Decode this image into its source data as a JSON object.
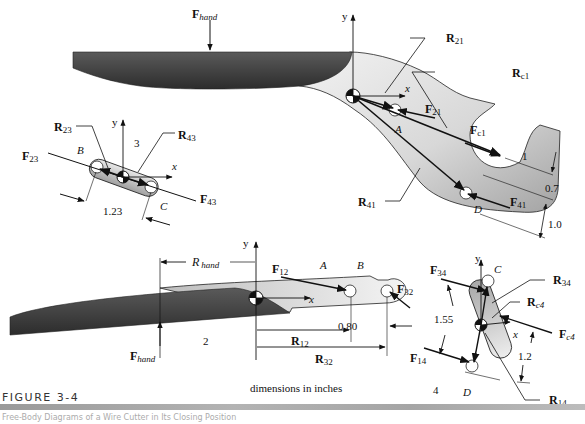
{
  "figure": {
    "title": "FIGURE 3-4",
    "caption": "Free-Body Diagrams of a Wire Cutter in Its Closing Position",
    "units_note": "dimensions in inches"
  },
  "link1": {
    "number": "1",
    "labels": {
      "F_hand": "F",
      "F_hand_sub": "hand",
      "y": "y",
      "x": "x",
      "R21": "R",
      "R21_sub": "21",
      "Rc1": "R",
      "Rc1_sub": "c1",
      "F21": "F",
      "F21_sub": "21",
      "Fc1": "F",
      "Fc1_sub": "c1",
      "R41": "R",
      "R41_sub": "41",
      "F41": "F",
      "F41_sub": "41",
      "A": "A",
      "D": "D"
    },
    "dimensions": {
      "d1": "1",
      "d2": "0.7",
      "d3": "1.0"
    }
  },
  "link3": {
    "number": "3",
    "labels": {
      "R23": "R",
      "R23_sub": "23",
      "R43": "R",
      "R43_sub": "43",
      "F23": "F",
      "F23_sub": "23",
      "F43": "F",
      "F43_sub": "43",
      "y": "y",
      "x": "x",
      "B": "B",
      "C": "C"
    },
    "dimensions": {
      "length": "1.23"
    }
  },
  "link2": {
    "number": "2",
    "labels": {
      "R_hand": "R",
      "R_hand_sub": "hand",
      "F_hand": "F",
      "F_hand_sub": "hand",
      "F12": "F",
      "F12_sub": "12",
      "F32": "F",
      "F32_sub": "32",
      "R12": "R",
      "R12_sub": "12",
      "R32": "R",
      "R32_sub": "32",
      "y": "y",
      "x": "x",
      "A": "A",
      "B": "B"
    },
    "dimensions": {
      "AB": "0.80"
    }
  },
  "link4": {
    "number": "4",
    "labels": {
      "F34": "F",
      "F34_sub": "34",
      "F14": "F",
      "F14_sub": "14",
      "Fc4": "F",
      "Fc4_sub": "c4",
      "R34": "R",
      "R34_sub": "34",
      "Rc4": "R",
      "Rc4_sub": "c4",
      "R14": "R",
      "R14_sub": "14",
      "y": "y",
      "x": "x",
      "C": "C",
      "D": "D"
    },
    "dimensions": {
      "length": "1.55",
      "offset": "1.2"
    }
  },
  "colors": {
    "blade_dark": "#3a3a3a",
    "link_fill_light": "#e6e6e6",
    "link_fill_dark": "#9d9d9d",
    "line": "#111111"
  }
}
